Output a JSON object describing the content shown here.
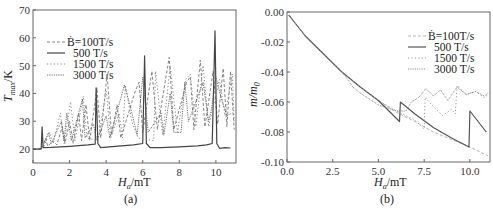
{
  "chart_data": [
    {
      "panel": "a",
      "type": "line",
      "caption": "(a)",
      "xlabel": "H_a/mT",
      "ylabel": "T_max/K",
      "xlim": [
        0,
        11.1
      ],
      "ylim": [
        15,
        70
      ],
      "xticks": [
        0,
        2,
        4,
        6,
        8,
        10
      ],
      "yticks": [
        20,
        30,
        40,
        50,
        60,
        70
      ],
      "grid": false,
      "legend_position": "upper left",
      "series": [
        {
          "name": "Ḃ=100T/s",
          "style": "dashed",
          "color": "#777777",
          "points": [
            [
              0,
              20
            ],
            [
              0.5,
              20.3
            ],
            [
              0.7,
              24
            ],
            [
              0.8,
              21
            ],
            [
              1.1,
              23
            ],
            [
              1.3,
              21.5
            ],
            [
              1.6,
              28
            ],
            [
              1.75,
              22
            ],
            [
              2.0,
              30
            ],
            [
              2.2,
              22
            ],
            [
              2.5,
              33
            ],
            [
              2.65,
              23
            ],
            [
              2.9,
              36
            ],
            [
              3.1,
              23
            ],
            [
              3.5,
              42
            ],
            [
              3.7,
              24
            ],
            [
              4.05,
              47
            ],
            [
              4.3,
              25
            ],
            [
              4.6,
              36
            ],
            [
              4.8,
              24
            ],
            [
              5.6,
              41
            ],
            [
              5.8,
              44
            ],
            [
              6.0,
              26
            ],
            [
              6.5,
              48
            ],
            [
              6.8,
              27
            ],
            [
              7.45,
              53
            ],
            [
              7.7,
              27
            ],
            [
              8.4,
              44
            ],
            [
              8.6,
              46
            ],
            [
              8.8,
              27
            ],
            [
              9.15,
              52
            ],
            [
              9.4,
              28
            ],
            [
              9.85,
              48
            ],
            [
              10.1,
              29
            ],
            [
              10.4,
              49
            ],
            [
              10.6,
              28
            ],
            [
              10.8,
              48
            ],
            [
              11.0,
              27
            ]
          ]
        },
        {
          "name": "500 T/s",
          "style": "solid",
          "color": "#444444",
          "points": [
            [
              0,
              20
            ],
            [
              0.45,
              20
            ],
            [
              0.5,
              28
            ],
            [
              0.55,
              20.5
            ],
            [
              1.0,
              20.6
            ],
            [
              2.0,
              21
            ],
            [
              3.0,
              21.5
            ],
            [
              3.4,
              21.8
            ],
            [
              3.45,
              42
            ],
            [
              3.55,
              22
            ],
            [
              3.7,
              20.5
            ],
            [
              4.5,
              21
            ],
            [
              5.5,
              21.5
            ],
            [
              6.0,
              22
            ],
            [
              6.1,
              53.5
            ],
            [
              6.2,
              22
            ],
            [
              6.4,
              20.5
            ],
            [
              7.0,
              20.5
            ],
            [
              8.0,
              20.8
            ],
            [
              9.0,
              21.2
            ],
            [
              9.5,
              21.5
            ],
            [
              9.8,
              22
            ],
            [
              9.95,
              62.5
            ],
            [
              10.05,
              22
            ],
            [
              10.2,
              20.3
            ],
            [
              10.5,
              20.5
            ],
            [
              10.8,
              20.4
            ]
          ]
        },
        {
          "name": "1500 T/s",
          "style": "dotted-sparse",
          "color": "#888888",
          "points": [
            [
              0.6,
              21
            ],
            [
              0.9,
              26
            ],
            [
              1.1,
              22
            ],
            [
              1.5,
              33
            ],
            [
              1.7,
              22
            ],
            [
              2.05,
              37
            ],
            [
              2.3,
              23
            ],
            [
              2.75,
              39
            ],
            [
              2.95,
              24
            ],
            [
              3.55,
              23
            ],
            [
              4.0,
              41
            ],
            [
              4.25,
              24
            ],
            [
              4.7,
              33
            ],
            [
              4.9,
              24
            ],
            [
              5.05,
              43
            ],
            [
              5.4,
              30
            ],
            [
              5.75,
              24
            ],
            [
              6.6,
              23
            ],
            [
              6.7,
              48
            ],
            [
              7.0,
              30
            ],
            [
              7.1,
              25
            ],
            [
              7.5,
              50
            ],
            [
              7.9,
              26
            ],
            [
              8.35,
              45
            ],
            [
              8.6,
              47
            ],
            [
              8.9,
              28
            ],
            [
              9.3,
              50
            ],
            [
              9.6,
              28
            ],
            [
              10.2,
              45
            ],
            [
              10.5,
              32
            ],
            [
              10.9,
              47
            ],
            [
              11.0,
              30
            ]
          ]
        },
        {
          "name": "3000 T/s",
          "style": "dotted-dense",
          "color": "#555555",
          "points": [
            [
              0.6,
              22
            ],
            [
              0.85,
              26
            ],
            [
              1.0,
              22
            ],
            [
              1.55,
              30
            ],
            [
              1.7,
              23
            ],
            [
              1.85,
              33
            ],
            [
              2.1,
              23
            ],
            [
              2.7,
              38
            ],
            [
              2.85,
              24
            ],
            [
              3.3,
              29
            ],
            [
              3.5,
              23
            ],
            [
              4.0,
              32
            ],
            [
              4.2,
              24
            ],
            [
              5.0,
              43
            ],
            [
              5.3,
              36
            ],
            [
              5.7,
              25
            ],
            [
              6.0,
              46
            ],
            [
              6.3,
              26
            ],
            [
              7.0,
              33
            ],
            [
              7.15,
              25
            ],
            [
              7.5,
              40
            ],
            [
              7.7,
              26
            ],
            [
              8.1,
              26
            ],
            [
              8.3,
              44
            ],
            [
              8.5,
              30
            ],
            [
              9.3,
              44
            ],
            [
              9.6,
              30
            ],
            [
              9.75,
              34
            ],
            [
              10.0,
              46
            ],
            [
              10.3,
              38
            ],
            [
              10.6,
              32
            ],
            [
              10.9,
              33
            ]
          ]
        }
      ]
    },
    {
      "panel": "b",
      "type": "line",
      "caption": "(b)",
      "xlabel": "H_a/mT",
      "ylabel": "m/m_0",
      "xlim": [
        0,
        11.1
      ],
      "ylim": [
        -0.1,
        0.0
      ],
      "xticks": [
        0.0,
        2.5,
        5.0,
        7.5,
        10.0
      ],
      "yticks": [
        0.0,
        -0.02,
        -0.04,
        -0.06,
        -0.08,
        -0.1
      ],
      "ytick_labels": [
        "0.00",
        "-0.02",
        "-0.04",
        "-0.06",
        "-0.08",
        "-0.10"
      ],
      "xtick_labels": [
        "0.0",
        "2.5",
        "5.0",
        "7.5",
        "10.0"
      ],
      "grid": false,
      "legend_position": "upper right",
      "series": [
        {
          "name": "Ḃ=100T/s",
          "style": "dashed",
          "color": "#aaaaaa",
          "points": [
            [
              0.1,
              -0.002
            ],
            [
              1.0,
              -0.016
            ],
            [
              2.0,
              -0.028
            ],
            [
              3.0,
              -0.04
            ],
            [
              4.0,
              -0.05
            ],
            [
              5.0,
              -0.059
            ],
            [
              6.0,
              -0.067
            ],
            [
              7.0,
              -0.073
            ],
            [
              8.0,
              -0.08
            ],
            [
              9.0,
              -0.085
            ],
            [
              10.0,
              -0.09
            ],
            [
              11.0,
              -0.096
            ]
          ]
        },
        {
          "name": "500 T/s",
          "style": "solid",
          "color": "#555555",
          "points": [
            [
              0.1,
              -0.002
            ],
            [
              1.0,
              -0.016
            ],
            [
              2.0,
              -0.028
            ],
            [
              3.0,
              -0.04
            ],
            [
              4.0,
              -0.05
            ],
            [
              5.0,
              -0.059
            ],
            [
              6.15,
              -0.073
            ],
            [
              6.2,
              -0.06
            ],
            [
              7.0,
              -0.068
            ],
            [
              8.0,
              -0.077
            ],
            [
              9.0,
              -0.084
            ],
            [
              9.95,
              -0.09
            ],
            [
              10.0,
              -0.066
            ],
            [
              10.9,
              -0.08
            ]
          ]
        },
        {
          "name": "1500 T/s",
          "style": "dotted-sparse",
          "color": "#999999",
          "points": [
            [
              0.1,
              -0.002
            ],
            [
              1.0,
              -0.016
            ],
            [
              2.0,
              -0.028
            ],
            [
              3.0,
              -0.04
            ],
            [
              4.0,
              -0.05
            ],
            [
              5.0,
              -0.059
            ],
            [
              6.0,
              -0.066
            ],
            [
              7.0,
              -0.072
            ],
            [
              7.5,
              -0.078
            ],
            [
              7.55,
              -0.057
            ],
            [
              8.0,
              -0.063
            ],
            [
              8.5,
              -0.069
            ],
            [
              9.0,
              -0.065
            ],
            [
              9.2,
              -0.068
            ],
            [
              9.3,
              -0.049
            ],
            [
              9.8,
              -0.055
            ],
            [
              10.3,
              -0.053
            ],
            [
              10.8,
              -0.057
            ],
            [
              11.0,
              -0.055
            ]
          ]
        },
        {
          "name": "3000 T/s",
          "style": "dotted-dense",
          "color": "#777777",
          "points": [
            [
              0.1,
              -0.002
            ],
            [
              1.0,
              -0.016
            ],
            [
              2.0,
              -0.028
            ],
            [
              3.0,
              -0.04
            ],
            [
              3.5,
              -0.048
            ],
            [
              3.6,
              -0.05
            ],
            [
              4.0,
              -0.054
            ],
            [
              4.5,
              -0.058
            ],
            [
              5.0,
              -0.062
            ],
            [
              5.5,
              -0.064
            ],
            [
              6.0,
              -0.066
            ],
            [
              6.5,
              -0.066
            ],
            [
              6.8,
              -0.06
            ],
            [
              7.2,
              -0.057
            ],
            [
              7.6,
              -0.051
            ],
            [
              8.0,
              -0.056
            ],
            [
              8.4,
              -0.052
            ],
            [
              8.8,
              -0.059
            ],
            [
              9.3,
              -0.05
            ],
            [
              9.8,
              -0.055
            ],
            [
              10.3,
              -0.053
            ],
            [
              10.8,
              -0.056
            ],
            [
              11.0,
              -0.054
            ]
          ]
        }
      ]
    }
  ],
  "panels": {
    "a": {
      "caption": "(a)",
      "xlabel_main": "H",
      "xlabel_sub": "a",
      "xlabel_unit": "/mT",
      "ylabel_main": "T",
      "ylabel_sub": "max",
      "ylabel_unit": "/K",
      "legend": [
        "Ḃ=100T/s",
        "500 T/s",
        "1500 T/s",
        "3000 T/s"
      ]
    },
    "b": {
      "caption": "(b)",
      "xlabel_main": "H",
      "xlabel_sub": "a",
      "xlabel_unit": "/mT",
      "ylabel_main": "m/m",
      "ylabel_sub": "0",
      "legend": [
        "Ḃ=100T/s",
        "500 T/s",
        "1500 T/s",
        "3000 T/s"
      ]
    }
  }
}
